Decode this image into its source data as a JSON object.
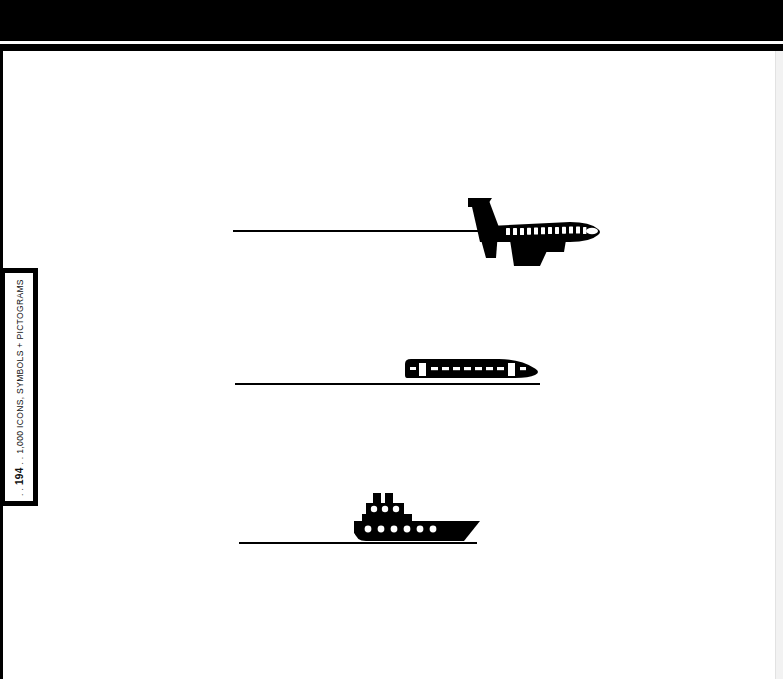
{
  "page": {
    "folio": "194",
    "running_head": "1,000 ICONS, SYMBOLS + PICTOGRAMS",
    "running_head_full": ". . 194 . . 1,000 ICONS, SYMBOLS + PICTOGRAMS",
    "dot_prefix": ". .",
    "dot_separator": ". .",
    "background_color": "#ffffff",
    "ink_color": "#000000"
  },
  "header": {
    "band_color": "#000000",
    "rule_color": "#000000",
    "gap_color": "#fdfdfd"
  },
  "pictograms": [
    {
      "name": "airplane",
      "icon": "airplane-icon",
      "label": "Airplane",
      "caption": "",
      "window_count": 14,
      "direction": "right",
      "rule_label": "flight path line"
    },
    {
      "name": "train",
      "icon": "train-icon",
      "label": "High-speed train",
      "caption": "",
      "window_count": 8,
      "door_count": 2,
      "direction": "right",
      "rule_label": "track line"
    },
    {
      "name": "ship",
      "icon": "ship-icon",
      "label": "Ship",
      "caption": "",
      "funnel_count": 2,
      "porthole_rows": 2,
      "direction": "right",
      "rule_label": "water line"
    }
  ]
}
